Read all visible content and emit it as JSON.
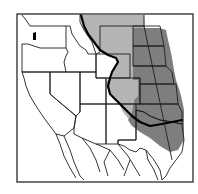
{
  "map": {
    "kind": "range map",
    "region": "Western United States and northern Mexico",
    "colors": {
      "background": "#ffffff",
      "frame": "#2a2a2a",
      "state_lines": "#1e1e1e",
      "light_zone": "#b4b4b4",
      "dark_zone": "#7e7e7e",
      "boundary_line": "#000000"
    },
    "legend": [],
    "labels": []
  }
}
